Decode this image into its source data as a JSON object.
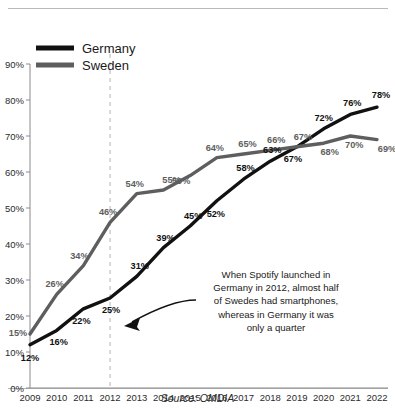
{
  "chart_data": {
    "type": "line",
    "title": "",
    "subtitle": "",
    "xlabel": "",
    "ylabel": "",
    "source": "Source: OMDIA",
    "grid": false,
    "legend_position": "top-left",
    "ylim": [
      0,
      90
    ],
    "ytick_labels": [
      "0%",
      "10%",
      "20%",
      "30%",
      "40%",
      "50%",
      "60%",
      "70%",
      "80%",
      "90%"
    ],
    "yticks": [
      0,
      10,
      20,
      30,
      40,
      50,
      60,
      70,
      80,
      90
    ],
    "categories": [
      "2009",
      "2010",
      "2011",
      "2012",
      "2013",
      "2014",
      "2015",
      "2016",
      "2017",
      "2018",
      "2019",
      "2020",
      "2021",
      "2022"
    ],
    "series": [
      {
        "name": "Germany",
        "color": "#111111",
        "values": [
          12,
          16,
          22,
          25,
          31,
          39,
          45,
          52,
          58,
          63,
          67,
          72,
          76,
          78
        ],
        "value_labels": [
          "12%",
          "16%",
          "22%",
          "25%",
          "31%",
          "39%",
          "45%",
          "52%",
          "58%",
          "63%",
          "67%",
          "72%",
          "76%",
          "78%"
        ]
      },
      {
        "name": "Sweden",
        "color": "#5e5e5e",
        "values": [
          15,
          26,
          34,
          46,
          54,
          55,
          59,
          64,
          65,
          66,
          67,
          68,
          70,
          69
        ],
        "value_labels": [
          "15%",
          "26%",
          "34%",
          "46%",
          "54%",
          "55%",
          "59%",
          "64%",
          "65%",
          "66%",
          "67%",
          "68%",
          "70%",
          "69%"
        ]
      }
    ],
    "marker_line": {
      "at_category": "2012",
      "style": "dashed",
      "color": "#c9c9c9"
    },
    "annotations": [
      {
        "lines": [
          "When Spotify launched in",
          "Germany in 2012, almost half",
          "of Swedes had smartphones,",
          "whereas in Germany it was",
          "only a quarter"
        ],
        "points_to": "2012"
      }
    ]
  },
  "legend": {
    "items": [
      {
        "label": "Germany",
        "color": "#111111"
      },
      {
        "label": "Sweden",
        "color": "#5e5e5e"
      }
    ]
  }
}
